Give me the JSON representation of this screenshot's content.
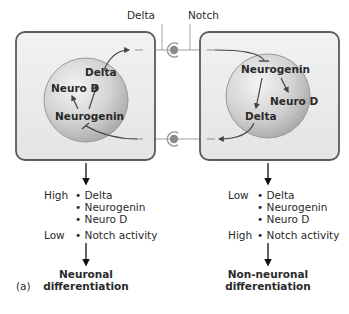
{
  "figure_label": "(a)",
  "ligands": {
    "delta_label": "Delta",
    "notch_label": "Notch"
  },
  "left_cell": {
    "nucleus": {
      "top_label": "Delta",
      "left_label": "Neuro D",
      "bottom_label": "Neurogenin"
    },
    "levels": [
      {
        "level": "High",
        "items": [
          "Delta",
          "Neurogenin",
          "Neuro D"
        ]
      },
      {
        "level": "Low",
        "items": [
          "Notch activity"
        ]
      }
    ],
    "outcome_line1": "Neuronal",
    "outcome_line2": "differentiation"
  },
  "right_cell": {
    "nucleus": {
      "top_label": "Neurogenin",
      "right_label": "Neuro D",
      "bottom_label": "Delta"
    },
    "levels": [
      {
        "level": "Low",
        "items": [
          "Delta",
          "Neurogenin",
          "Neuro D"
        ]
      },
      {
        "level": "High",
        "items": [
          "Notch activity"
        ]
      }
    ],
    "outcome_line1": "Non-neuronal",
    "outcome_line2": "differentiation"
  },
  "colors": {
    "cell_border": "#5a5a5a",
    "cell_fill": "#ececec",
    "nucleus_fill": "#c8c8c8",
    "connector": "#9a9a9a",
    "arrow": "#444444"
  }
}
